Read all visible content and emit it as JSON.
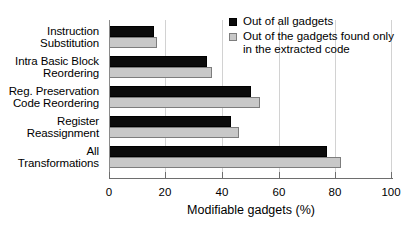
{
  "chart_data": {
    "type": "bar",
    "orientation": "horizontal",
    "title": "",
    "xlabel": "Modifiable gadgets (%)",
    "ylabel": "",
    "xlim": [
      0,
      100
    ],
    "xticks": [
      0,
      20,
      40,
      60,
      80,
      100
    ],
    "xtick_labels": [
      "0",
      "20",
      "40",
      "60",
      "80",
      "100"
    ],
    "grid": true,
    "grid_axis": "x",
    "legend_position": "top-right",
    "categories": [
      "Instruction Substitution",
      "Intra Basic Block Reordering",
      "Reg. Preservation Code Reordering",
      "Register Reassignment",
      "All Transformations"
    ],
    "category_lines": [
      [
        "Instruction",
        "Substitution"
      ],
      [
        "Intra Basic Block",
        "Reordering"
      ],
      [
        "Reg. Preservation",
        "Code Reordering"
      ],
      [
        "Register",
        "Reassignment"
      ],
      [
        "All",
        "Transformations"
      ]
    ],
    "series": [
      {
        "name": "Out of all gadgets",
        "color": "#0b0b0b",
        "values": [
          16,
          34.5,
          50,
          43,
          77
        ]
      },
      {
        "name": "Out of the gadgets found only in the extracted code",
        "color": "#c8c8c8",
        "values": [
          17,
          36.5,
          53.5,
          46,
          82
        ]
      }
    ]
  },
  "legend": {
    "entries": [
      {
        "label_line1": "Out of all gadgets",
        "label_line2": ""
      },
      {
        "label_line1": "Out of the gadgets found only",
        "label_line2": "in the extracted code"
      }
    ]
  }
}
